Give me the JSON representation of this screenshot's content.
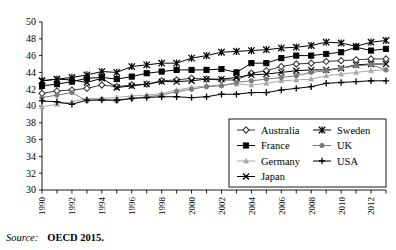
{
  "source": {
    "label": "Source:",
    "text": "OECD 2015."
  },
  "legend": {
    "position": "inside-lower-right",
    "entries": [
      {
        "label": "Australia",
        "marker": "diamond-open-marker",
        "color": "#3a3a3a"
      },
      {
        "label": "France",
        "marker": "square-filled-marker",
        "color": "#000000"
      },
      {
        "label": "Germany",
        "marker": "triangle-small-marker",
        "color": "#a8a8a8"
      },
      {
        "label": "Japan",
        "marker": "cross-x-marker",
        "color": "#000000"
      },
      {
        "label": "Sweden",
        "marker": "asterisk-marker",
        "color": "#000000"
      },
      {
        "label": "UK",
        "marker": "circle-filled-marker",
        "color": "#7a7a7a"
      },
      {
        "label": "USA",
        "marker": "plus-marker",
        "color": "#000000"
      }
    ]
  },
  "chart_data": {
    "type": "line",
    "title": "",
    "xlabel": "",
    "ylabel": "",
    "grid": false,
    "xlim": [
      1990,
      2013
    ],
    "ylim": [
      30,
      50
    ],
    "ytick_values": [
      30,
      32,
      34,
      36,
      38,
      40,
      42,
      44,
      46,
      48,
      50
    ],
    "ytick_labels": [
      "30",
      "32",
      "34",
      "36",
      "38",
      "40",
      "42",
      "44",
      "46",
      "48",
      "50"
    ],
    "x": [
      1990,
      1991,
      1992,
      1993,
      1994,
      1995,
      1996,
      1997,
      1998,
      1999,
      2000,
      2001,
      2002,
      2003,
      2004,
      2005,
      2006,
      2007,
      2008,
      2009,
      2010,
      2011,
      2012,
      2013
    ],
    "xtick_labels": [
      "1990",
      "",
      "1992",
      "",
      "1994",
      "",
      "1996",
      "",
      "1998",
      "",
      "2000",
      "",
      "2002",
      "",
      "2004",
      "",
      "2006",
      "",
      "2008",
      "",
      "2010",
      "",
      "2012",
      ""
    ],
    "xtick_labels_shown": [
      "1990",
      "1992",
      "1994",
      "1996",
      "1998",
      "2000",
      "2002",
      "2004",
      "2006",
      "2008",
      "2010",
      "2012"
    ],
    "series": [
      {
        "name": "Australia",
        "marker": "diamond-open-marker",
        "color": "#3a3a3a",
        "values": [
          41.5,
          41.8,
          41.9,
          42.1,
          42.5,
          42.3,
          42.5,
          42.6,
          43.0,
          43.1,
          43.3,
          43.2,
          43.1,
          43.1,
          43.9,
          44.2,
          44.7,
          45.0,
          45.1,
          45.3,
          45.4,
          45.5,
          45.6,
          45.6
        ]
      },
      {
        "name": "France",
        "marker": "square-filled-marker",
        "color": "#000000",
        "values": [
          42.4,
          42.6,
          42.9,
          43.3,
          43.4,
          43.2,
          43.5,
          43.9,
          44.1,
          44.3,
          44.3,
          44.3,
          44.4,
          44.0,
          45.1,
          45.1,
          45.7,
          46.0,
          46.0,
          46.2,
          46.4,
          47.0,
          46.6,
          46.8
        ]
      },
      {
        "name": "Germany",
        "marker": "triangle-small-marker",
        "color": "#a8a8a8",
        "values": [
          39.9,
          40.2,
          40.5,
          40.9,
          40.9,
          41.0,
          41.2,
          41.3,
          41.5,
          41.9,
          42.2,
          42.4,
          42.5,
          42.6,
          42.5,
          42.7,
          43.0,
          43.1,
          43.2,
          43.6,
          43.8,
          44.0,
          44.2,
          44.3
        ]
      },
      {
        "name": "Japan",
        "marker": "cross-x-marker",
        "color": "#000000",
        "values": [
          43.0,
          43.2,
          43.1,
          42.8,
          43.3,
          42.2,
          42.4,
          42.6,
          42.9,
          42.9,
          43.0,
          43.2,
          43.2,
          43.4,
          43.7,
          43.8,
          44.0,
          44.2,
          44.3,
          44.3,
          44.5,
          44.9,
          45.0,
          45.0
        ]
      },
      {
        "name": "Sweden",
        "marker": "asterisk-marker",
        "color": "#000000",
        "values": [
          43.0,
          43.2,
          43.4,
          43.7,
          44.1,
          44.0,
          44.7,
          44.9,
          45.1,
          45.1,
          45.7,
          46.0,
          46.4,
          46.5,
          46.6,
          46.7,
          46.9,
          47.0,
          47.2,
          47.6,
          47.5,
          47.1,
          47.6,
          47.8
        ]
      },
      {
        "name": "UK",
        "marker": "circle-filled-marker",
        "color": "#7a7a7a",
        "values": [
          41.0,
          41.3,
          41.6,
          40.6,
          40.8,
          40.6,
          40.9,
          41.1,
          41.3,
          41.7,
          42.0,
          42.3,
          42.4,
          42.8,
          43.0,
          43.2,
          43.4,
          43.6,
          44.0,
          44.2,
          44.5,
          44.8,
          44.9,
          44.3
        ]
      },
      {
        "name": "USA",
        "marker": "plus-marker",
        "color": "#000000",
        "values": [
          40.6,
          40.5,
          40.2,
          40.7,
          40.7,
          40.7,
          40.9,
          41.0,
          41.1,
          41.1,
          41.0,
          41.1,
          41.4,
          41.4,
          41.6,
          41.6,
          41.9,
          42.1,
          42.3,
          42.7,
          42.8,
          42.9,
          43.0,
          43.0
        ]
      }
    ]
  }
}
